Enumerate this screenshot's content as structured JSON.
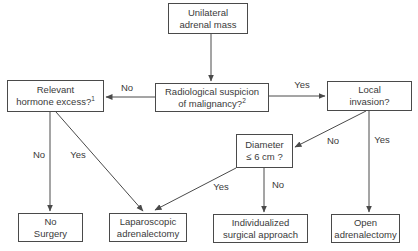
{
  "colors": {
    "line": "#4a4a4a",
    "text": "#3a3a3a",
    "box_bg": "#ffffff",
    "background": "#ffffff"
  },
  "nodes": {
    "unilateral": {
      "line1": "Unilateral",
      "line2": "adrenal mass"
    },
    "radiological": {
      "line1": "Radiological suspicion",
      "line2": "of malignancy?",
      "sup": "2"
    },
    "hormone": {
      "line1": "Relevant",
      "line2": "hormone excess?",
      "sup": "1"
    },
    "local": {
      "line1": "Local",
      "line2": "invasion?"
    },
    "diameter": {
      "line1": "Diameter",
      "line2": "≤ 6 cm ?"
    },
    "no_surgery": {
      "line1": "No",
      "line2": "Surgery"
    },
    "laparoscopic": {
      "line1": "Laparoscopic",
      "line2": "adrenalectomy"
    },
    "individualized": {
      "line1": "Individualized",
      "line2": "surgical approach"
    },
    "open": {
      "line1": "Open",
      "line2": "adrenalectomy"
    }
  },
  "edge_labels": {
    "rad_to_hormone": "No",
    "rad_to_local": "Yes",
    "hormone_to_no_surgery": "No",
    "hormone_to_laparoscopic": "Yes",
    "local_to_diameter": "No",
    "local_to_open": "Yes",
    "diameter_to_laparoscopic": "Yes",
    "diameter_to_individualized": "No"
  }
}
